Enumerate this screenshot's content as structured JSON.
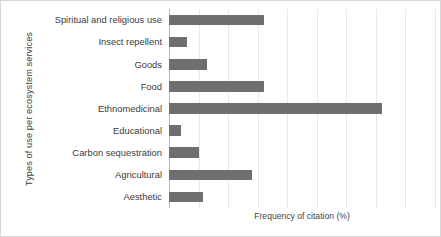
{
  "chart_data": {
    "type": "bar",
    "orientation": "horizontal",
    "title": "",
    "xlabel": "Frequency of citation (%)",
    "ylabel": "Types of use per ecosystem services",
    "categories": [
      "Spiritual and religious use",
      "Insect repellent",
      "Goods",
      "Food",
      "Ethnomedicinal",
      "Educational",
      "Carbon sequestration",
      "Agricultural",
      "Aesthetic"
    ],
    "values": [
      32,
      6,
      13,
      32,
      72,
      4,
      10,
      28,
      11.5
    ],
    "xlim": [
      0,
      90
    ],
    "xticks": [
      0,
      10,
      20,
      30,
      40,
      50,
      60,
      70,
      80,
      90
    ],
    "grid": "vertical",
    "legend": "none",
    "bar_color": "#6f6f6f",
    "gridline_color": "#e9e9e9",
    "axis_color": "#b9b9b9",
    "background": "#ffffff"
  },
  "axes": {
    "x_title": "Frequency of citation (%)",
    "y_title": "Types of use per ecosystem services"
  }
}
